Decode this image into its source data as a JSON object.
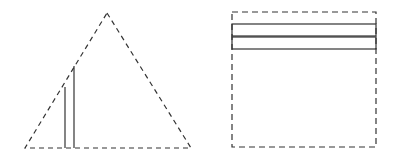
{
  "diagram": {
    "colors": {
      "stroke": "#333333",
      "background": "#ffffff"
    },
    "triangle": {
      "apex": [
        107,
        13
      ],
      "base_left": [
        25,
        148
      ],
      "base_right": [
        191,
        148
      ],
      "inner_lines": [
        {
          "x": 65,
          "y_top": 87,
          "y_bottom": 148
        },
        {
          "x": 74,
          "y_top": 66,
          "y_bottom": 148
        }
      ]
    },
    "square": {
      "left": 232,
      "top": 12,
      "right": 376,
      "bottom": 147,
      "strips": [
        {
          "y_top": 24,
          "y_bottom": 36
        },
        {
          "y_top": 37,
          "y_bottom": 49
        }
      ]
    }
  }
}
